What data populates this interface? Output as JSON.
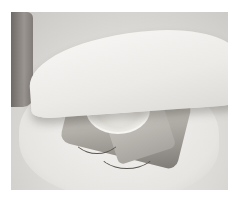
{
  "image": {
    "description": "Grayscale photo of a hand folding parchment paper over a fish fillet topped with a lemon slice and herbs",
    "subjects": [
      "hand",
      "parchment-paper",
      "fish-fillet",
      "lemon-slice",
      "herbs"
    ],
    "colors": {
      "paper": "#ecebe8",
      "shadow": "#c9c7c3",
      "fish": "#a09c96",
      "hand": "#8a8581",
      "lemon": "#f4f3ef"
    }
  }
}
